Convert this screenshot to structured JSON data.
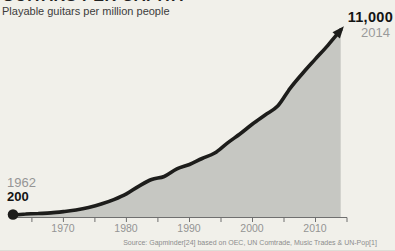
{
  "page": {
    "background": "#f1f0ea"
  },
  "header": {
    "clipped_title": "GUITARS PER CAPITA",
    "subtitle": "Playable guitars per million people"
  },
  "annotations": {
    "start": {
      "year": "1962",
      "value": "200"
    },
    "end": {
      "value": "11,000",
      "year": "2014"
    }
  },
  "footer": {
    "source": "Source: Gapminder[24] based on OEC, UN Comtrade, Music Trades & UN-Pop[1]"
  },
  "chart_data": {
    "type": "area",
    "title": "GUITARS PER CAPITA",
    "subtitle": "Playable guitars per million people",
    "xlabel": "",
    "ylabel": "Playable guitars per million people",
    "xlim": [
      1962,
      2015
    ],
    "ylim": [
      0,
      11000
    ],
    "grid": false,
    "legend": "none",
    "x_ticks": {
      "labeled_years": [
        1970,
        1980,
        1990,
        2000,
        2010
      ],
      "minor_tick_start": 1965,
      "minor_tick_end": 2015,
      "minor_every": 5
    },
    "series": [
      {
        "name": "Playable guitars per million people",
        "points": [
          [
            1962,
            200
          ],
          [
            1964,
            260
          ],
          [
            1966,
            290
          ],
          [
            1968,
            320
          ],
          [
            1970,
            400
          ],
          [
            1972,
            490
          ],
          [
            1974,
            640
          ],
          [
            1976,
            840
          ],
          [
            1978,
            1100
          ],
          [
            1980,
            1430
          ],
          [
            1982,
            1890
          ],
          [
            1984,
            2270
          ],
          [
            1986,
            2450
          ],
          [
            1988,
            2890
          ],
          [
            1990,
            3150
          ],
          [
            1992,
            3500
          ],
          [
            1994,
            3820
          ],
          [
            1996,
            4400
          ],
          [
            1998,
            4930
          ],
          [
            2000,
            5510
          ],
          [
            2002,
            6040
          ],
          [
            2004,
            6560
          ],
          [
            2006,
            7610
          ],
          [
            2008,
            8490
          ],
          [
            2010,
            9310
          ],
          [
            2012,
            10120
          ],
          [
            2014,
            11000
          ]
        ]
      }
    ],
    "point_annotations": [
      {
        "year": 1962,
        "value": 200,
        "label_year": "1962",
        "label_value": "200",
        "marker": "dot"
      },
      {
        "year": 2014,
        "value": 11000,
        "label_year": "2014",
        "label_value": "11,000",
        "marker": "arrow"
      }
    ],
    "colors": {
      "background": "#f1f0ea",
      "area_fill": "#c6c7c2",
      "line": "#1d1d1b",
      "axis": "#6f6f6f",
      "tick_label": "#949494",
      "muted_label": "#9a9a9a",
      "emphasis_label": "#141414"
    }
  }
}
